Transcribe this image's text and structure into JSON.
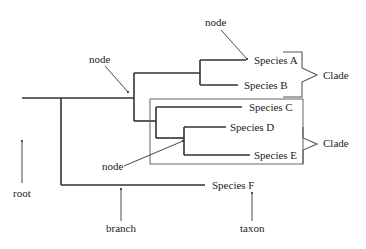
{
  "diagram": {
    "taxa": [
      {
        "id": "A",
        "label": "Species A"
      },
      {
        "id": "B",
        "label": "Species B"
      },
      {
        "id": "C",
        "label": "Species C"
      },
      {
        "id": "D",
        "label": "Species D"
      },
      {
        "id": "E",
        "label": "Species E"
      },
      {
        "id": "F",
        "label": "Species F"
      }
    ],
    "annotations": {
      "node_top": "node",
      "node_mid": "node",
      "node_low": "node",
      "root": "root",
      "branch": "branch",
      "taxon": "taxon",
      "clade_top": "Clade",
      "clade_bottom": "Clade"
    },
    "colors": {
      "tree": "#333333",
      "box": "#555555",
      "text": "#222222"
    }
  }
}
